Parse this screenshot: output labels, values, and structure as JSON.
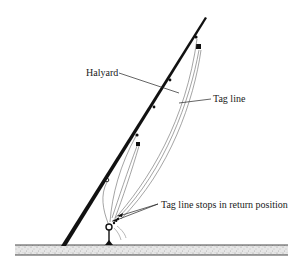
{
  "diagram": {
    "labels": {
      "halyard": "Halyard",
      "tag_line": "Tag line",
      "tag_line_stops": "Tag line stops in return position"
    },
    "colors": {
      "ink": "#1a1a1a",
      "rope": "#555555",
      "ground_fill": "#d9d9d9",
      "background": "#ffffff"
    }
  }
}
